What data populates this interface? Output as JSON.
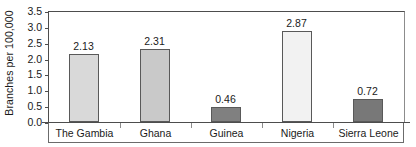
{
  "chart_data": {
    "type": "bar",
    "title": "",
    "subtitle": "",
    "xlabel": "",
    "ylabel": "Branches per 100,000",
    "categories": [
      "The Gambia",
      "Ghana",
      "Guinea",
      "Nigeria",
      "Sierra Leone"
    ],
    "values": [
      2.13,
      2.31,
      0.46,
      2.87,
      0.72
    ],
    "value_labels": [
      "2.13",
      "2.31",
      "0.46",
      "2.87",
      "0.72"
    ],
    "bar_colors": [
      "#d9d9d9",
      "#c9c9c9",
      "#808080",
      "#f2f2f2",
      "#787878"
    ],
    "bar_border_color": "#595959",
    "ylim": [
      0.0,
      3.5
    ],
    "ytick_values": [
      0.0,
      0.5,
      1.0,
      1.5,
      2.0,
      2.5,
      3.0,
      3.5
    ],
    "ytick_labels": [
      "0.0",
      "0.5",
      "1.0",
      "1.5",
      "2.0",
      "2.5",
      "3.0",
      "3.5"
    ],
    "grid": false,
    "legend": false,
    "legend_position": "none",
    "annotations": []
  },
  "axes": {
    "y_title": "Branches per 100,000",
    "y_ticks": [
      {
        "label": "3.5",
        "value": 3.5
      },
      {
        "label": "3.0",
        "value": 3.0
      },
      {
        "label": "2.5",
        "value": 2.5
      },
      {
        "label": "2.0",
        "value": 2.0
      },
      {
        "label": "1.5",
        "value": 1.5
      },
      {
        "label": "1.0",
        "value": 1.0
      },
      {
        "label": "0.5",
        "value": 0.5
      },
      {
        "label": "0.0",
        "value": 0.0
      }
    ]
  },
  "categories": [
    {
      "label": "The Gambia",
      "value": 2.13,
      "value_label": "2.13",
      "color": "#d9d9d9"
    },
    {
      "label": "Ghana",
      "value": 2.31,
      "value_label": "2.31",
      "color": "#c9c9c9"
    },
    {
      "label": "Guinea",
      "value": 0.46,
      "value_label": "0.46",
      "color": "#808080"
    },
    {
      "label": "Nigeria",
      "value": 2.87,
      "value_label": "2.87",
      "color": "#f2f2f2"
    },
    {
      "label": "Sierra Leone",
      "value": 0.72,
      "value_label": "0.72",
      "color": "#787878"
    }
  ]
}
